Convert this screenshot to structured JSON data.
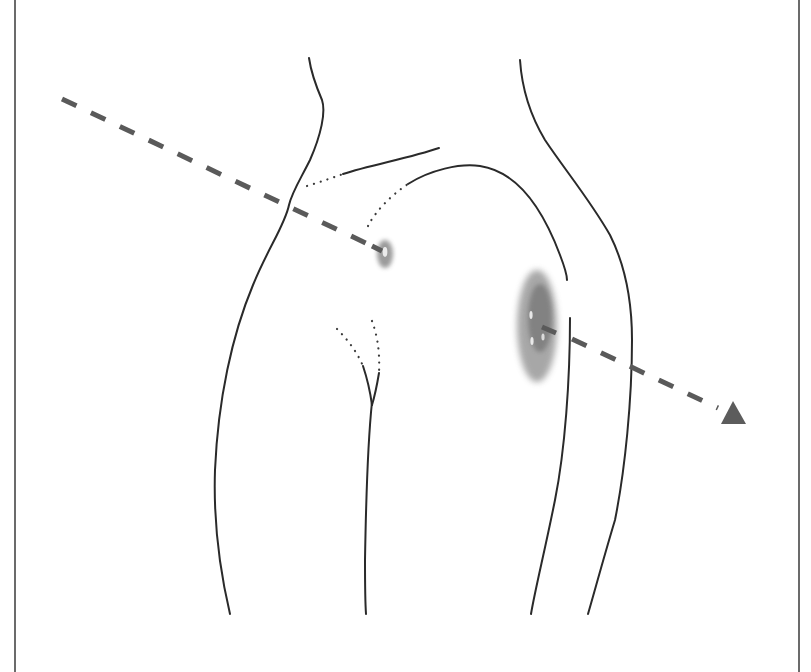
{
  "diagram": {
    "colors": {
      "background": "#ffffff",
      "outline": "#2a2a2a",
      "trajectory": "#5a5a5a",
      "wound_small": "#8a8a8a",
      "wound_large": "#7a7a7a",
      "arrowhead": "#5c5c5c",
      "frame": "#3a3a3a"
    },
    "elements": {
      "trajectory": {
        "label": "trajectory-line",
        "style": "dashed",
        "start": [
          62,
          99
        ],
        "end": [
          718,
          410
        ]
      },
      "arrowhead": {
        "label": "direction-arrowhead",
        "shape": "triangle"
      },
      "wound_entry": {
        "label": "small-wound",
        "center": [
          384,
          254
        ]
      },
      "wound_exit": {
        "label": "large-wound",
        "center": [
          537,
          326
        ]
      }
    },
    "text": []
  }
}
